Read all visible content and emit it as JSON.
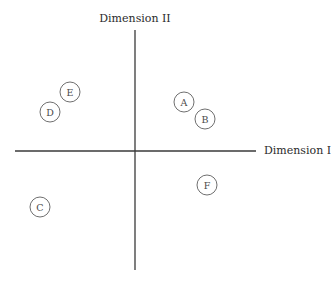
{
  "chart_data": {
    "type": "scatter",
    "title": "",
    "xlabel": "Dimension I",
    "ylabel": "Dimension II",
    "grid": false,
    "legend": null,
    "axes_style": "crossed axes through origin, no ticks",
    "xlim": [
      -120,
      121
    ],
    "ylim": [
      -120,
      120
    ],
    "points": [
      {
        "label": "A",
        "x": 49,
        "y": 49
      },
      {
        "label": "B",
        "x": 70,
        "y": 32
      },
      {
        "label": "C",
        "x": -95,
        "y": -56
      },
      {
        "label": "D",
        "x": -85,
        "y": 39
      },
      {
        "label": "E",
        "x": -65,
        "y": 59
      },
      {
        "label": "F",
        "x": 72,
        "y": -34
      }
    ]
  },
  "layout": {
    "origin_px": [
      135,
      151
    ],
    "h_axis_px": [
      15,
      256
    ],
    "v_axis_px": [
      30,
      270
    ],
    "point_radius_px": 10
  }
}
